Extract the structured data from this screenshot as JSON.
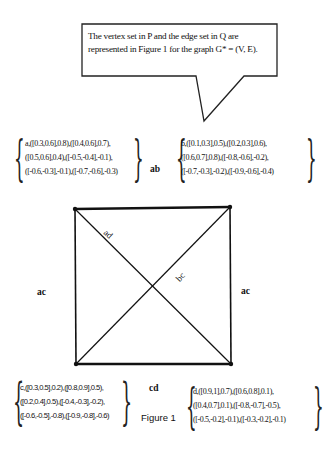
{
  "callout": {
    "text": "The vertex set in P and the edge set in Q are represented in Figure 1 for the graph G* = (V, E)."
  },
  "vertices": {
    "a": {
      "rows": [
        "a,([0.3,0.6],0.8),([0.4,0.6],0.7),",
        "([0.5,0.6],0.4),([-0.5,-0.4],-0.1),",
        "([-0.6,-0.3],-0.1),([-0.7,-0.6],-0.3)"
      ]
    },
    "b": {
      "rows": [
        "b,([0.1,0.3],0.5),([0.2,0.3],0.6),",
        "([0.6,0.7],0.8),([-0.8,-0.6],-0.2),",
        "([-0.7,-0.3],-0.2),([-0.9,-0.6],-0.4)"
      ]
    },
    "c": {
      "rows": [
        "c,([0.3,0.5],0.2),([0.8,0.9],0.5),",
        "([0.2,0.4],0.5),([-0.4,-0.3],-0.2),",
        "([-0.6,-0.5],-0.8),([-0.9,-0.8],-0.6)"
      ]
    },
    "d": {
      "rows": [
        "d,([0.9,1],0.7),([0.6,0.8],0.1),",
        "([0.4,0.7],0.1),([-0.8,-0.7],-0.5),",
        "([-0.5,-0.2],-0.1),([-0.3,-0.2],-0.1)"
      ]
    }
  },
  "edges": {
    "top": "ab",
    "left": "ac",
    "right": "ac",
    "bottom": "cd",
    "diag_main": "ad",
    "diag_anti": "bc"
  },
  "caption": "Figure 1"
}
